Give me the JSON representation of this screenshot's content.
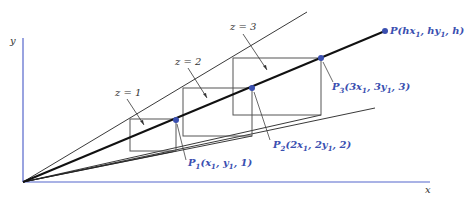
{
  "diagram": {
    "title": "",
    "axes": {
      "y_label": "y",
      "x_label": "x",
      "color": "#5566cc"
    },
    "depth_labels": [
      "z = 1",
      "z = 2",
      "z = 3"
    ],
    "points": {
      "P1": {
        "name": "P",
        "sub": "1",
        "coords": "(x",
        "sx": "1",
        "mid": ", y",
        "sy": "1",
        "tail": ", 1)"
      },
      "P2": {
        "name": "P",
        "sub": "2",
        "coords": "(2x",
        "sx": "1",
        "mid": ", 2y",
        "sy": "1",
        "tail": ", 2)"
      },
      "P3": {
        "name": "P",
        "sub": "3",
        "coords": "(3x",
        "sx": "1",
        "mid": ", 3y",
        "sy": "1",
        "tail": ", 3)"
      },
      "P": {
        "name": "P",
        "coords": "(hx",
        "sx": "1",
        "mid": ", hy",
        "sy": "1",
        "tail": ", h)"
      }
    },
    "colors": {
      "point": "#3a4fb0",
      "line": "#222222",
      "box": "#555555",
      "axis": "#5566cc"
    }
  }
}
